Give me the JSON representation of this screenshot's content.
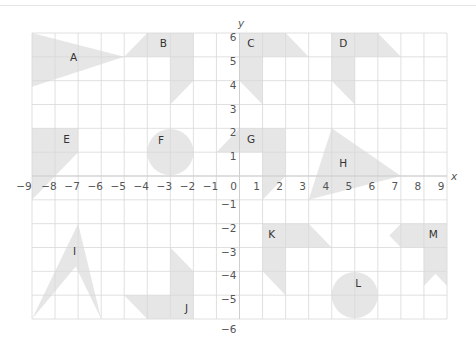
{
  "grid": {
    "x_range": [
      -9,
      9
    ],
    "y_range": [
      -6,
      6
    ],
    "x_axis_label": "x",
    "y_axis_label": "y",
    "x_ticks": [
      "−9",
      "−8",
      "−7",
      "−6",
      "−5",
      "−4",
      "−3",
      "−2",
      "−1",
      "0",
      "1",
      "2",
      "3",
      "4",
      "5",
      "6",
      "7",
      "8",
      "9"
    ],
    "y_ticks": [
      "6",
      "5",
      "4",
      "3",
      "2",
      "1",
      "−1",
      "−2",
      "−3",
      "−4",
      "−5",
      "−6"
    ],
    "grid_color": "#d8d8d8",
    "shape_fill": "#e6e6e6"
  },
  "shapes": [
    {
      "label": "A",
      "kind": "polygon",
      "points": [
        [
          -9,
          6
        ],
        [
          -5,
          5
        ],
        [
          -9,
          3.75
        ]
      ],
      "label_at": [
        -7.2,
        5
      ]
    },
    {
      "label": "B",
      "kind": "polygon",
      "points": [
        [
          -4,
          6
        ],
        [
          -2,
          6
        ],
        [
          -2,
          4
        ],
        [
          -3,
          3
        ],
        [
          -3,
          5
        ],
        [
          -5,
          5
        ]
      ],
      "label_at": [
        -3.3,
        5.6
      ]
    },
    {
      "label": "C",
      "kind": "polygon",
      "points": [
        [
          0,
          6
        ],
        [
          2,
          6
        ],
        [
          3,
          5
        ],
        [
          1,
          5
        ],
        [
          1,
          3
        ],
        [
          0,
          4
        ]
      ],
      "label_at": [
        0.5,
        5.6
      ]
    },
    {
      "label": "D",
      "kind": "polygon",
      "points": [
        [
          4,
          6
        ],
        [
          6,
          6
        ],
        [
          7,
          5
        ],
        [
          5,
          5
        ],
        [
          5,
          3
        ],
        [
          4,
          4
        ]
      ],
      "label_at": [
        4.5,
        5.6
      ]
    },
    {
      "label": "E",
      "kind": "polygon",
      "points": [
        [
          -9,
          2
        ],
        [
          -7,
          2
        ],
        [
          -7,
          1
        ],
        [
          -9,
          -1
        ]
      ],
      "label_at": [
        -7.5,
        1.55
      ]
    },
    {
      "label": "F",
      "kind": "circle",
      "center": [
        -3,
        1
      ],
      "r": 1,
      "label_at": [
        -3.4,
        1.5
      ]
    },
    {
      "label": "G",
      "kind": "polygon",
      "points": [
        [
          -1,
          1
        ],
        [
          0,
          2
        ],
        [
          2,
          2
        ],
        [
          2,
          0
        ],
        [
          1,
          -1
        ],
        [
          1,
          1
        ]
      ],
      "label_at": [
        0.5,
        1.55
      ]
    },
    {
      "label": "H",
      "kind": "polygon",
      "points": [
        [
          4,
          2
        ],
        [
          7,
          0
        ],
        [
          3,
          -1
        ]
      ],
      "label_at": [
        4.5,
        0.55
      ]
    },
    {
      "label": "I",
      "kind": "polygon",
      "points": [
        [
          -7,
          -2
        ],
        [
          -6,
          -6
        ],
        [
          -7.1,
          -3.8
        ],
        [
          -9,
          -6
        ]
      ],
      "label_at": [
        -7.15,
        -3.15
      ]
    },
    {
      "label": "J",
      "kind": "polygon",
      "points": [
        [
          -3,
          -3
        ],
        [
          -2,
          -4
        ],
        [
          -2,
          -6
        ],
        [
          -4,
          -6
        ],
        [
          -5,
          -5
        ],
        [
          -3,
          -5
        ]
      ],
      "label_at": [
        -2.3,
        -5.55
      ]
    },
    {
      "label": "K",
      "kind": "polygon",
      "points": [
        [
          1,
          -2
        ],
        [
          3,
          -2
        ],
        [
          4,
          -3
        ],
        [
          2,
          -3
        ],
        [
          2,
          -5
        ],
        [
          1,
          -4
        ]
      ],
      "label_at": [
        1.4,
        -2.45
      ]
    },
    {
      "label": "L",
      "kind": "circle",
      "center": [
        5,
        -5
      ],
      "r": 1,
      "label_at": [
        5.15,
        -4.5
      ]
    },
    {
      "label": "M",
      "kind": "polygon",
      "points": [
        [
          7,
          -2
        ],
        [
          9,
          -2
        ],
        [
          9,
          -4.6
        ],
        [
          8.5,
          -4.1
        ],
        [
          8,
          -4.6
        ],
        [
          8,
          -3
        ],
        [
          7,
          -3
        ],
        [
          6.5,
          -2.5
        ]
      ],
      "label_at": [
        8.4,
        -2.45
      ]
    }
  ]
}
